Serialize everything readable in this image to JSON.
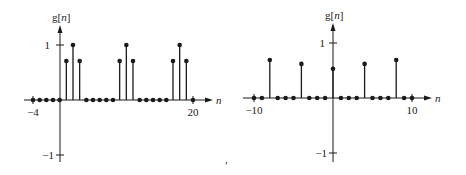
{
  "chart_data": [
    {
      "type": "stem",
      "title": "",
      "ylabel": "g[n]",
      "xlabel": "n",
      "xlim": [
        -4,
        20
      ],
      "ylim": [
        -1,
        1
      ],
      "x_tick_labels": [
        "-4",
        "20"
      ],
      "y_tick_labels": [
        "1",
        "-1"
      ],
      "x": [
        -4,
        -3,
        -2,
        -1,
        0,
        1,
        2,
        3,
        4,
        5,
        6,
        7,
        8,
        9,
        10,
        11,
        12,
        13,
        14,
        15,
        16,
        17,
        18,
        19,
        20
      ],
      "values": [
        0,
        0,
        0,
        0,
        0,
        0.71,
        1,
        0.71,
        0,
        0,
        0,
        0,
        0,
        0.71,
        1,
        0.71,
        0,
        0,
        0,
        0,
        0,
        0.71,
        1,
        0.71,
        0
      ],
      "grid": false
    },
    {
      "type": "stem",
      "title": "",
      "ylabel": "g[n]",
      "xlabel": "n",
      "xlim": [
        -10,
        10
      ],
      "ylim": [
        -1,
        1
      ],
      "x_tick_labels": [
        "-10",
        "10"
      ],
      "y_tick_labels": [
        "1",
        "-1"
      ],
      "x": [
        -10,
        -9,
        -8,
        -7,
        -6,
        -5,
        -4,
        -3,
        -2,
        -1,
        0,
        1,
        2,
        3,
        4,
        5,
        6,
        7,
        8,
        9,
        10
      ],
      "values": [
        0,
        0,
        0.69,
        0,
        0,
        0,
        0.62,
        0,
        0,
        0,
        0.53,
        0,
        0,
        0,
        0.62,
        0,
        0,
        0,
        0.69,
        0,
        0
      ],
      "grid": false
    }
  ],
  "labels": {
    "left": {
      "ylabel_main": "g[",
      "ylabel_var": "n",
      "ylabel_close": "]",
      "xlabel": "n",
      "ytick_pos": "1",
      "ytick_neg": "−1",
      "xtick_min": "−4",
      "xtick_max": "20"
    },
    "right": {
      "ylabel_main": "g[",
      "ylabel_var": "n",
      "ylabel_close": "]",
      "xlabel": "n",
      "ytick_pos": "1",
      "ytick_neg": "−1",
      "xtick_min": "−10",
      "xtick_max": "10"
    },
    "separator": ","
  }
}
